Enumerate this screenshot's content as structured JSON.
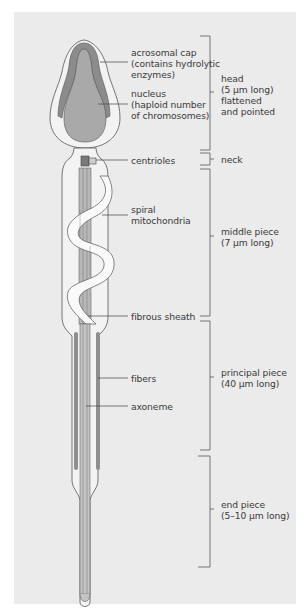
{
  "figure": {
    "colors": {
      "background": "#ebebeb",
      "membrane_fill": "#f3f3f3",
      "acrosome": "#8c8c8c",
      "nucleus": "#a9a9a9",
      "mitochondria": "#fafafa",
      "outline": "#555555",
      "leader_line": "#444444"
    }
  },
  "structure_labels": [
    {
      "id": "acrosomal_cap",
      "text": "acrosomal cap\n(contains hydrolytic\nenzymes)"
    },
    {
      "id": "nucleus",
      "text": "nucleus\n(haploid number\nof chromosomes)"
    },
    {
      "id": "centrioles",
      "text": "centrioles"
    },
    {
      "id": "spiral_mitochondria",
      "text": "spiral\nmitochondria"
    },
    {
      "id": "fibrous_sheath",
      "text": "fibrous sheath"
    },
    {
      "id": "fibers",
      "text": "fibers"
    },
    {
      "id": "axoneme",
      "text": "axoneme"
    }
  ],
  "region_labels": [
    {
      "id": "head",
      "text": "head\n(5 µm long)\nflattened\nand pointed"
    },
    {
      "id": "neck",
      "text": "neck"
    },
    {
      "id": "middle_piece",
      "text": "middle piece\n(7 µm long)"
    },
    {
      "id": "principal_piece",
      "text": "principal piece\n(40 µm long)"
    },
    {
      "id": "end_piece",
      "text": "end piece\n(5–10 µm long)"
    }
  ]
}
